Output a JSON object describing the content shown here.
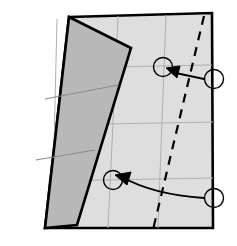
{
  "figure": {
    "kind": "origami-fold-diagram",
    "title": "",
    "canvas": {
      "width": 237,
      "height": 246,
      "background": "#ffffff"
    },
    "colors": {
      "sheet_fill": "#dedede",
      "flap_fill": "#b8b8b8",
      "outline": "#000000",
      "crease_line": "#8a8a8a",
      "grid_line": "#b0b0b0",
      "marker_stroke": "#000000",
      "arrow_stroke": "#000000",
      "fold_line_dash": "#000000",
      "page_background": "#ffffff"
    },
    "stroke_widths": {
      "outline": 2.6,
      "flap_outline": 2.6,
      "grid": 1.0,
      "crease": 1.0,
      "dash": 2.2,
      "marker": 1.4,
      "arrow": 1.8
    }
  },
  "sheet": {
    "label": "main-sheet",
    "points": "69,17 212,13 213,228 45,228",
    "description": "large light gray quadrilateral paper sheet"
  },
  "flap": {
    "label": "folded-flap",
    "points": "69,17 131,48 77,225 45,228",
    "description": "narrow tapered darker gray folded flap on the left"
  },
  "flap_creases": [
    {
      "name": "flap-crease-upper",
      "points": "45,99 118,85"
    },
    {
      "name": "flap-crease-lower",
      "points": "36,160 95,150"
    }
  ],
  "grid_lines": [
    {
      "name": "grid-vertical-left",
      "points": "57,19 52,228"
    },
    {
      "name": "grid-vertical-mid",
      "points": "118,16 108,228"
    },
    {
      "name": "grid-vertical-right",
      "points": "166,15 158,228"
    },
    {
      "name": "grid-horizontal-upper",
      "points": "62,68 212,65"
    },
    {
      "name": "grid-horizontal-mid",
      "points": "54,125 213,122"
    },
    {
      "name": "grid-horizontal-lower",
      "points": "48,181 213,178"
    }
  ],
  "fold_line": {
    "name": "valley-fold-dashed-line",
    "points": "204,16 152,234",
    "dash_pattern": "9,7",
    "style": "dashed"
  },
  "markers": [
    {
      "name": "target-marker-upper",
      "cx": 163,
      "cy": 67,
      "r": 9.5,
      "role": "destination point on sheet"
    },
    {
      "name": "source-marker-upper-right",
      "cx": 214,
      "cy": 79,
      "r": 9.5,
      "role": "source point on right edge"
    },
    {
      "name": "target-marker-lower",
      "cx": 113,
      "cy": 180,
      "r": 9.5,
      "role": "destination point on sheet"
    },
    {
      "name": "source-marker-lower-right",
      "cx": 214,
      "cy": 198,
      "r": 9.5,
      "role": "source point on right edge"
    }
  ],
  "arrows": [
    {
      "name": "fold-arrow-upper",
      "path": "M 204,79 L 171,72",
      "head": "166,68 180,66 177,78",
      "description": "straight arrow pointing up-left from right edge marker to upper target marker"
    },
    {
      "name": "fold-arrow-lower",
      "path": "M 204,198 C 175,196 145,190 122,177",
      "head": "115,175 131,172 127,185",
      "description": "curved arrow sweeping left from lower right edge marker to lower target marker"
    }
  ]
}
